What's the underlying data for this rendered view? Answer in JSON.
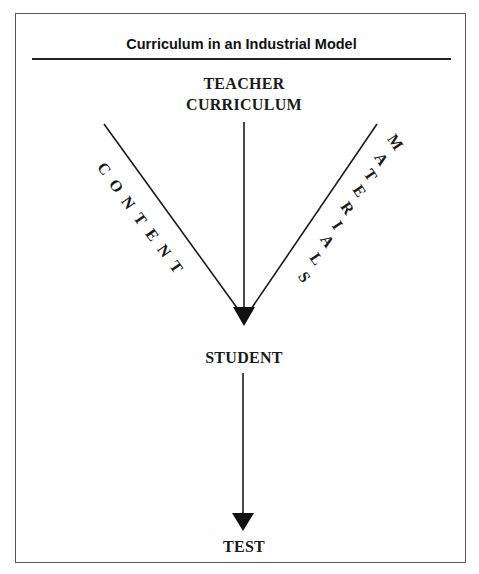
{
  "title": "Curriculum in an Industrial Model",
  "nodes": {
    "top_line1": "TEACHER",
    "top_line2": "CURRICULUM",
    "middle": "STUDENT",
    "bottom": "TEST"
  },
  "edges": {
    "left_label": "CONTENT",
    "right_label": "MATERIALS"
  },
  "labels": {
    "left_letters": [
      "C",
      "O",
      "N",
      "T",
      "E",
      "N",
      "T"
    ],
    "right_letters": [
      "M",
      "A",
      "T",
      "E",
      "R",
      "I",
      "A",
      "L",
      "S"
    ]
  },
  "colors": {
    "line": "#1a1a1a",
    "frame": "#555555"
  }
}
